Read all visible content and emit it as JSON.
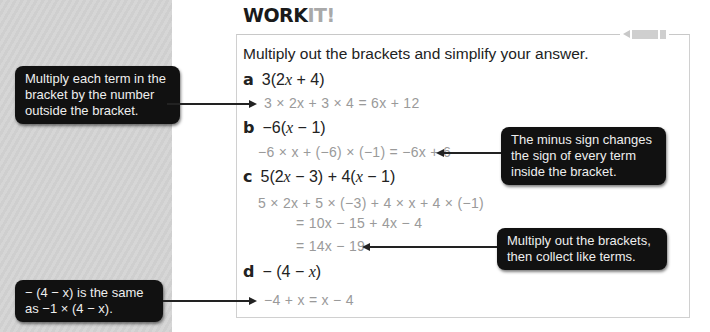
{
  "header": {
    "title_main": "WORK",
    "title_accent": "IT!"
  },
  "instruction": "Multiply out the brackets and simplify your answer.",
  "questions": [
    {
      "label": "a",
      "expr_pre": "3(2",
      "expr_var": "x",
      "expr_post": " + 4)",
      "working": [
        "3 × 2x + 3 × 4 = 6x + 12"
      ]
    },
    {
      "label": "b",
      "expr_pre": "−6(",
      "expr_var": "x",
      "expr_post": " − 1)",
      "working": [
        "−6 × x + (−6) × (−1) = −6x + 6"
      ]
    },
    {
      "label": "c",
      "expr_pre": "5(2",
      "expr_var": "x",
      "expr_post": " − 3) + 4(",
      "expr_var2": "x",
      "expr_post2": " − 1)",
      "working": [
        "5 × 2x + 5 × (−3) + 4 × x + 4 × (−1)",
        "= 10x − 15 + 4x − 4",
        "= 14x − 19"
      ]
    },
    {
      "label": "d",
      "expr_pre": "− (4 − ",
      "expr_var": "x",
      "expr_post": ")",
      "working": [
        "−4 + x = x − 4"
      ]
    }
  ],
  "callouts": {
    "multiply_each": "Multiply each term in the bracket by the number outside the bracket.",
    "minus_sign": "The minus sign changes the sign of every term inside the bracket.",
    "collect": "Multiply out the brackets, then collect like terms.",
    "same_as": "− (4 − x) is the same as −1 × (4 − x)."
  }
}
